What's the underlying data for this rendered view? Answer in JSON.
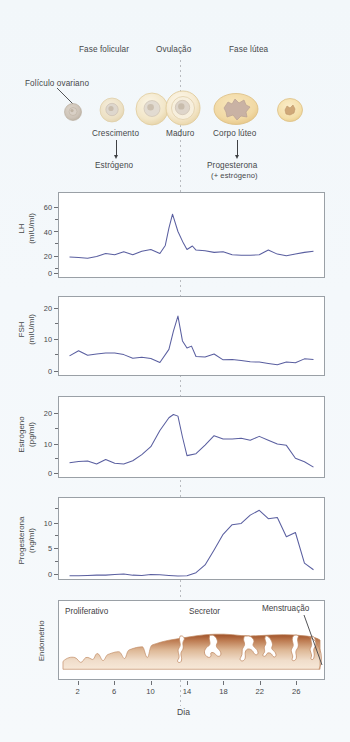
{
  "figure": {
    "title_top_labels": [
      {
        "text": "Fase folicular",
        "x": 78,
        "y": 48
      },
      {
        "text": "Ovulação",
        "x": 157,
        "y": 48
      },
      {
        "text": "Ovulação_dummy",
        "x": 0,
        "y": 0
      },
      {
        "text": "Fase lútea",
        "x": 228,
        "y": 48
      }
    ],
    "follicle_callout": "Folículo ovariano",
    "stage_labels": [
      "Crescimento",
      "Maduro",
      "Corpo lúteo"
    ],
    "hormone_labels": [
      "Estrógeno",
      "Progesterona",
      "(+ estrógeno)"
    ],
    "xaxis_label": "Dia",
    "xticks": [
      2,
      6,
      10,
      14,
      18,
      22,
      26
    ]
  },
  "chart_data": [
    {
      "type": "line",
      "name": "LH",
      "ylabel": "LH",
      "yunits": "(mIU/ml)",
      "ylim": [
        0,
        70
      ],
      "yticks": [
        0,
        20,
        40,
        60
      ],
      "yminor": [
        10,
        30,
        50
      ],
      "xlabel": "Dia",
      "xlim": [
        0,
        29
      ],
      "grid": false,
      "color": "#5a5fa0",
      "x": [
        1,
        2,
        3,
        4,
        5,
        6,
        7,
        8,
        9,
        10,
        11,
        11.6,
        12,
        12.4,
        13,
        13.6,
        14,
        14.6,
        15,
        16,
        17,
        18,
        19,
        20,
        21,
        22,
        23,
        24,
        25,
        26,
        27,
        28
      ],
      "values": [
        16,
        15.5,
        15,
        16.5,
        19,
        18,
        20.5,
        18,
        21,
        22.5,
        19,
        26,
        41,
        53,
        38,
        28,
        22.5,
        25.5,
        22,
        21.5,
        20,
        20.5,
        18,
        17.5,
        17.5,
        18,
        22,
        18.5,
        17,
        18.5,
        20,
        21
      ]
    },
    {
      "type": "line",
      "name": "FSH",
      "ylabel": "FSH",
      "yunits": "(mIU/ml)",
      "ylim": [
        0,
        23
      ],
      "yticks": [
        0,
        10,
        20
      ],
      "yminor": [
        5,
        15
      ],
      "xlabel": "Dia",
      "xlim": [
        0,
        29
      ],
      "grid": false,
      "color": "#5a5fa0",
      "x": [
        1,
        2,
        3,
        4,
        5,
        6,
        7,
        8,
        9,
        10,
        11,
        12,
        12.5,
        13,
        13.5,
        14,
        14.5,
        15,
        16,
        17,
        18,
        19,
        20,
        21,
        22,
        23,
        24,
        25,
        26,
        27,
        28
      ],
      "values": [
        5.4,
        7,
        5.6,
        6,
        6.3,
        6.3,
        5.8,
        4.7,
        5,
        4.6,
        3.4,
        7.4,
        13,
        17.6,
        10,
        7.8,
        8.4,
        5.2,
        5.1,
        6,
        4.2,
        4.3,
        4,
        3.6,
        3.5,
        3.1,
        2.7,
        3.5,
        3.3,
        4.5,
        4.3
      ]
    },
    {
      "type": "line",
      "name": "Estrógeno",
      "ylabel": "Estrógeno",
      "yunits": "(pg/ml)",
      "ylim": [
        0,
        24
      ],
      "yticks": [
        0,
        10,
        20
      ],
      "yminor": [
        5,
        15
      ],
      "xlabel": "Dia",
      "xlim": [
        0,
        29
      ],
      "grid": false,
      "color": "#5a5fa0",
      "x": [
        1,
        2,
        3,
        4,
        5,
        6,
        7,
        8,
        9,
        10,
        11,
        12,
        12.5,
        13,
        13.5,
        14,
        15,
        16,
        17,
        18,
        19,
        20,
        21,
        22,
        23,
        24,
        25,
        26,
        27,
        28
      ],
      "values": [
        4,
        4.4,
        4.5,
        3.6,
        5,
        3.8,
        3.6,
        4.6,
        6.5,
        9,
        14,
        18,
        19,
        18.5,
        12,
        6.2,
        6.8,
        9.5,
        12.4,
        11.4,
        11.4,
        11.6,
        11,
        12.2,
        11,
        9.8,
        9.4,
        5.4,
        4.3,
        2.6
      ]
    },
    {
      "type": "line",
      "name": "Progesterona",
      "ylabel": "Progesterona",
      "yunits": "(ng/ml)",
      "ylim": [
        0,
        13
      ],
      "yticks": [
        0,
        5,
        10
      ],
      "yminor": [
        2.5,
        7.5,
        12.5
      ],
      "xlabel": "Dia",
      "xlim": [
        0,
        29
      ],
      "grid": false,
      "color": "#5a5fa0",
      "x": [
        1,
        2,
        3,
        4,
        5,
        6,
        7,
        8,
        9,
        10,
        11,
        12,
        13,
        14,
        15,
        16,
        17,
        18,
        19,
        20,
        21,
        22,
        23,
        24,
        25,
        26,
        27,
        28
      ],
      "values": [
        0.3,
        0.3,
        0.35,
        0.4,
        0.4,
        0.5,
        0.6,
        0.4,
        0.35,
        0.5,
        0.45,
        0.35,
        0.25,
        0.3,
        0.8,
        2.1,
        4.6,
        7.2,
        8.8,
        9,
        10.4,
        11.2,
        9.8,
        10,
        6.8,
        7.5,
        2.4,
        1.3
      ]
    }
  ],
  "endometrium": {
    "ylabel": "Endométrio",
    "phases": [
      "Proliferativo",
      "Secretor",
      "Menstruação"
    ]
  },
  "colors": {
    "curve": "#5a5fa0",
    "panel_border": "#9aa0a6",
    "background": "#f2f7fa",
    "endometrium_dark": "#9a4e28",
    "endometrium_light": "#f3ddc9",
    "follicle_outer": "#f2dca8",
    "follicle_inner": "#e4ded6",
    "corpus_luteum": "#e8c98f"
  }
}
